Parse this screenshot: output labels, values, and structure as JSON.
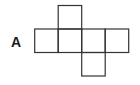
{
  "diagram": {
    "type": "cube-net",
    "label": "A",
    "cell_size": 23.5,
    "stroke_color": "#333333",
    "cells": [
      {
        "row": 0,
        "col": 1
      },
      {
        "row": 1,
        "col": 0
      },
      {
        "row": 1,
        "col": 1
      },
      {
        "row": 1,
        "col": 2
      },
      {
        "row": 1,
        "col": 3
      },
      {
        "row": 2,
        "col": 2
      }
    ]
  }
}
